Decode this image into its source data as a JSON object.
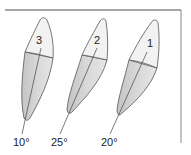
{
  "diagram": {
    "type": "tooth-angulation",
    "colors": {
      "crown": "#f2f2f2",
      "root_light": "#e0e0e0",
      "root_dark": "#c2c2c2",
      "outline": "#555555",
      "frame": "#777777"
    },
    "teeth": [
      {
        "number": "3",
        "angle": "10°"
      },
      {
        "number": "2",
        "angle": "25°"
      },
      {
        "number": "1",
        "angle": "20°"
      }
    ]
  }
}
